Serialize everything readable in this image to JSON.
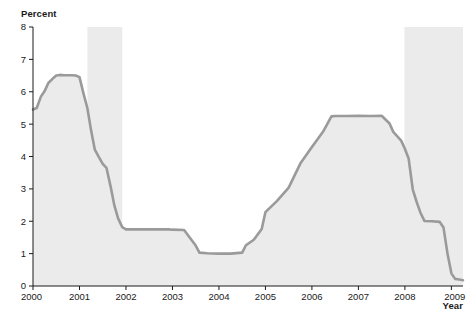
{
  "chart_data": {
    "type": "area",
    "title": "",
    "subtitle": "",
    "xlabel": "Year",
    "ylabel": "Percent",
    "xlim": [
      2000,
      2009.25
    ],
    "ylim": [
      0,
      8
    ],
    "grid": false,
    "legend": null,
    "x_ticks": [
      "2000",
      "2001",
      "2002",
      "2003",
      "2004",
      "2005",
      "2006",
      "2007",
      "2008",
      "2009"
    ],
    "x_tick_values": [
      2000,
      2001,
      2002,
      2003,
      2004,
      2005,
      2006,
      2007,
      2008,
      2009
    ],
    "y_ticks": [
      "0",
      "1",
      "2",
      "3",
      "4",
      "5",
      "6",
      "7",
      "8"
    ],
    "y_tick_values": [
      0,
      1,
      2,
      3,
      4,
      5,
      6,
      7,
      8
    ],
    "series": [
      {
        "name": "Percent",
        "line_color": "#9a9a9a",
        "fill_color": "#ebebeb",
        "x": [
          2000.0,
          2000.08,
          2000.17,
          2000.25,
          2000.33,
          2000.42,
          2000.5,
          2000.58,
          2000.67,
          2000.75,
          2000.83,
          2000.92,
          2001.0,
          2001.08,
          2001.17,
          2001.25,
          2001.33,
          2001.42,
          2001.5,
          2001.58,
          2001.67,
          2001.75,
          2001.83,
          2001.92,
          2002.0,
          2002.25,
          2002.5,
          2002.75,
          2002.92,
          2003.0,
          2003.25,
          2003.5,
          2003.58,
          2003.75,
          2004.0,
          2004.25,
          2004.5,
          2004.58,
          2004.75,
          2004.92,
          2005.0,
          2005.25,
          2005.5,
          2005.75,
          2006.0,
          2006.25,
          2006.42,
          2006.5,
          2006.75,
          2007.0,
          2007.25,
          2007.5,
          2007.67,
          2007.75,
          2007.92,
          2008.0,
          2008.08,
          2008.17,
          2008.25,
          2008.33,
          2008.42,
          2008.58,
          2008.75,
          2008.83,
          2008.92,
          2009.0,
          2009.08,
          2009.17,
          2009.25
        ],
        "y": [
          5.45,
          5.5,
          5.85,
          6.02,
          6.27,
          6.4,
          6.5,
          6.52,
          6.51,
          6.51,
          6.51,
          6.5,
          6.45,
          5.98,
          5.49,
          4.8,
          4.21,
          3.97,
          3.77,
          3.65,
          3.07,
          2.49,
          2.09,
          1.82,
          1.75,
          1.75,
          1.75,
          1.75,
          1.75,
          1.74,
          1.73,
          1.25,
          1.03,
          1.01,
          1.0,
          1.0,
          1.03,
          1.26,
          1.43,
          1.76,
          2.28,
          2.63,
          3.04,
          3.78,
          4.29,
          4.79,
          5.24,
          5.25,
          5.25,
          5.26,
          5.25,
          5.26,
          5.02,
          4.76,
          4.49,
          4.24,
          3.94,
          2.98,
          2.61,
          2.28,
          2.01,
          2.0,
          1.98,
          1.81,
          0.97,
          0.39,
          0.22,
          0.2,
          0.18
        ]
      }
    ],
    "shaded_bands": [
      {
        "name": "recession-2001",
        "x_start": 2001.17,
        "x_end": 2001.92,
        "color": "#ebebeb"
      },
      {
        "name": "recession-2008",
        "x_start": 2007.99,
        "x_end": 2009.25,
        "color": "#ebebeb"
      }
    ],
    "axis_color": "#1a1a1a",
    "background_color": "#ffffff"
  }
}
